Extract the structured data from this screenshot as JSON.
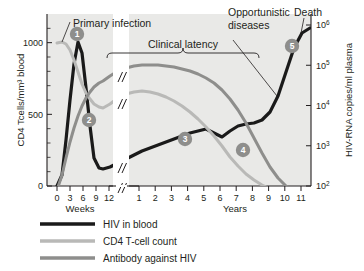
{
  "chart_data": {
    "type": "line",
    "title": "",
    "panel_bg": "#e9e9e7",
    "xlabel_left": "Weeks",
    "xlabel_right": "Years",
    "ylabel_left": "CD4 Tcells/mm³ blood",
    "ylabel_right": "HIV-RNA copies/ml plasma",
    "x_ticks_weeks": [
      "0",
      "3",
      "6",
      "9",
      "12"
    ],
    "x_ticks_years": [
      "1",
      "2",
      "3",
      "4",
      "5",
      "6",
      "7",
      "8",
      "9",
      "10",
      "11"
    ],
    "y_ticks_left": [
      "0",
      "500",
      "1000"
    ],
    "y_ticks_right": [
      {
        "base": "10",
        "exp": "2"
      },
      {
        "base": "10",
        "exp": "3"
      },
      {
        "base": "10",
        "exp": "4"
      },
      {
        "base": "10",
        "exp": "5"
      },
      {
        "base": "10",
        "exp": "6"
      }
    ],
    "axis_break": "//",
    "ylim_left": [
      0,
      1200
    ],
    "ylim_right_log": [
      2,
      6
    ],
    "grid": false,
    "legend_position": "below-left",
    "series": [
      {
        "name": "HIV in blood",
        "color": "#1a1a1a",
        "axis": "right",
        "points_px": [
          [
            57,
            186
          ],
          [
            62,
            175
          ],
          [
            66,
            140
          ],
          [
            70,
            100
          ],
          [
            74,
            64
          ],
          [
            78,
            42
          ],
          [
            82,
            53
          ],
          [
            86,
            88
          ],
          [
            90,
            126
          ],
          [
            94,
            158
          ],
          [
            99,
            168
          ],
          [
            103,
            169
          ],
          [
            110,
            167
          ],
          [
            118,
            163
          ],
          [
            126,
            159
          ],
          [
            134,
            155
          ],
          [
            142,
            151
          ],
          [
            150,
            148
          ],
          [
            158,
            145
          ],
          [
            166,
            142
          ],
          [
            174,
            139
          ],
          [
            182,
            136
          ],
          [
            190,
            133
          ],
          [
            198,
            131
          ],
          [
            206,
            129
          ],
          [
            214,
            133
          ],
          [
            222,
            137
          ],
          [
            230,
            131
          ],
          [
            238,
            126
          ],
          [
            246,
            124
          ],
          [
            254,
            123
          ],
          [
            262,
            120
          ],
          [
            270,
            112
          ],
          [
            278,
            96
          ],
          [
            286,
            72
          ],
          [
            294,
            48
          ],
          [
            302,
            33
          ],
          [
            310,
            28
          ]
        ]
      },
      {
        "name": "CD4 T-cell count",
        "color": "#b9b9b7",
        "axis": "left",
        "points_px": [
          [
            57,
            43
          ],
          [
            62,
            42
          ],
          [
            66,
            44
          ],
          [
            70,
            50
          ],
          [
            74,
            60
          ],
          [
            78,
            72
          ],
          [
            82,
            84
          ],
          [
            86,
            93
          ],
          [
            90,
            99
          ],
          [
            94,
            104
          ],
          [
            99,
            107
          ],
          [
            103,
            108
          ],
          [
            110,
            104
          ],
          [
            118,
            98
          ],
          [
            126,
            94
          ],
          [
            134,
            92
          ],
          [
            142,
            91
          ],
          [
            150,
            92
          ],
          [
            158,
            94
          ],
          [
            166,
            97
          ],
          [
            174,
            101
          ],
          [
            182,
            106
          ],
          [
            190,
            112
          ],
          [
            198,
            119
          ],
          [
            206,
            127
          ],
          [
            214,
            136
          ],
          [
            222,
            146
          ],
          [
            230,
            157
          ],
          [
            238,
            166
          ],
          [
            246,
            174
          ],
          [
            254,
            180
          ],
          [
            262,
            185
          ],
          [
            270,
            189
          ],
          [
            278,
            192
          ],
          [
            286,
            194
          ],
          [
            294,
            195
          ],
          [
            302,
            196
          ],
          [
            310,
            196
          ]
        ]
      },
      {
        "name": "Antibody against HIV",
        "color": "#8e8e8c",
        "axis": "left",
        "points_px": [
          [
            57,
            190
          ],
          [
            62,
            175
          ],
          [
            66,
            158
          ],
          [
            70,
            142
          ],
          [
            74,
            128
          ],
          [
            78,
            116
          ],
          [
            82,
            106
          ],
          [
            86,
            98
          ],
          [
            90,
            92
          ],
          [
            94,
            87
          ],
          [
            99,
            83
          ],
          [
            103,
            81
          ],
          [
            110,
            76
          ],
          [
            118,
            71
          ],
          [
            126,
            68
          ],
          [
            134,
            66
          ],
          [
            142,
            65
          ],
          [
            150,
            65
          ],
          [
            158,
            65
          ],
          [
            166,
            66
          ],
          [
            174,
            67
          ],
          [
            182,
            69
          ],
          [
            190,
            71
          ],
          [
            198,
            74
          ],
          [
            206,
            78
          ],
          [
            214,
            83
          ],
          [
            222,
            90
          ],
          [
            230,
            99
          ],
          [
            238,
            110
          ],
          [
            246,
            123
          ],
          [
            254,
            138
          ],
          [
            262,
            153
          ],
          [
            270,
            167
          ],
          [
            278,
            178
          ],
          [
            286,
            186
          ],
          [
            294,
            191
          ],
          [
            302,
            194
          ],
          [
            310,
            196
          ]
        ]
      }
    ],
    "annotations": [
      {
        "id": "primary-infection",
        "label": "Primary infection"
      },
      {
        "id": "clinical-latency",
        "label": "Clinical latency"
      },
      {
        "id": "opportunistic-diseases",
        "label": "Opportunistic\ndiseases"
      },
      {
        "id": "opportunistic-diseases-line1",
        "label": "Opportunistic"
      },
      {
        "id": "opportunistic-diseases-line2",
        "label": "diseases"
      },
      {
        "id": "death",
        "label": "Death"
      }
    ],
    "markers": [
      {
        "number": "1",
        "x": 77,
        "y": 34
      },
      {
        "number": "2",
        "x": 89,
        "y": 120
      },
      {
        "number": "3",
        "x": 185,
        "y": 139
      },
      {
        "number": "4",
        "x": 243,
        "y": 150
      },
      {
        "number": "5",
        "x": 292,
        "y": 46
      }
    ],
    "legend": [
      {
        "label": "HIV in blood",
        "color": "#1a1a1a"
      },
      {
        "label": "CD4 T-cell count",
        "color": "#b9b9b7"
      },
      {
        "label": "Antibody against HIV",
        "color": "#8e8e8c"
      }
    ]
  }
}
